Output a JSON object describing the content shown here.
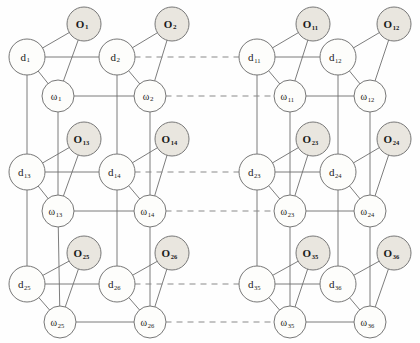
{
  "figure": {
    "type": "node-link-diagram",
    "width": 420,
    "height": 343
  },
  "style": {
    "o_fill": "#e9e6df",
    "o_stroke": "#777777",
    "d_fill": "#fdfdfb",
    "d_stroke": "#777777",
    "w_fill": "#fdfdfb",
    "w_stroke": "#777777",
    "edge_color": "#6e6e6e",
    "dashed_color": "#8a8a8a",
    "background": "#fefefe"
  },
  "geometry": {
    "radius_o": 17,
    "radius_d": 18,
    "radius_w": 16,
    "row_y": {
      "o": [
        24,
        139,
        253
      ],
      "d": [
        57,
        172,
        284
      ],
      "w": [
        96,
        211,
        322
      ]
    },
    "col_x": {
      "d": [
        27,
        117,
        257,
        338
      ],
      "o": [
        84,
        172,
        313,
        394
      ],
      "w": [
        58,
        150,
        290,
        370
      ]
    }
  },
  "nodes": {
    "observation": [
      {
        "id": "O1",
        "label": "O",
        "sub": "1",
        "x": 84,
        "y": 24
      },
      {
        "id": "O2",
        "label": "O",
        "sub": "2",
        "x": 172,
        "y": 24
      },
      {
        "id": "O11",
        "label": "O",
        "sub": "11",
        "x": 313,
        "y": 24
      },
      {
        "id": "O12",
        "label": "O",
        "sub": "12",
        "x": 394,
        "y": 24
      },
      {
        "id": "O13",
        "label": "O",
        "sub": "13",
        "x": 84,
        "y": 139
      },
      {
        "id": "O14",
        "label": "O",
        "sub": "14",
        "x": 172,
        "y": 139
      },
      {
        "id": "O23",
        "label": "O",
        "sub": "23",
        "x": 313,
        "y": 139
      },
      {
        "id": "O24",
        "label": "O",
        "sub": "24",
        "x": 394,
        "y": 139
      },
      {
        "id": "O25",
        "label": "O",
        "sub": "25",
        "x": 84,
        "y": 253
      },
      {
        "id": "O26",
        "label": "O",
        "sub": "26",
        "x": 172,
        "y": 253
      },
      {
        "id": "O35",
        "label": "O",
        "sub": "35",
        "x": 313,
        "y": 253
      },
      {
        "id": "O36",
        "label": "O",
        "sub": "36",
        "x": 394,
        "y": 253
      }
    ],
    "decision": [
      {
        "id": "d1",
        "label": "d",
        "sub": "1",
        "x": 27,
        "y": 57
      },
      {
        "id": "d2",
        "label": "d",
        "sub": "2",
        "x": 117,
        "y": 57
      },
      {
        "id": "d11",
        "label": "d",
        "sub": "11",
        "x": 257,
        "y": 57
      },
      {
        "id": "d12",
        "label": "d",
        "sub": "12",
        "x": 338,
        "y": 57
      },
      {
        "id": "d13",
        "label": "d",
        "sub": "13",
        "x": 27,
        "y": 172
      },
      {
        "id": "d14",
        "label": "d",
        "sub": "14",
        "x": 117,
        "y": 172
      },
      {
        "id": "d23",
        "label": "d",
        "sub": "23",
        "x": 257,
        "y": 172
      },
      {
        "id": "d24",
        "label": "d",
        "sub": "24",
        "x": 338,
        "y": 172
      },
      {
        "id": "d25",
        "label": "d",
        "sub": "25",
        "x": 27,
        "y": 284
      },
      {
        "id": "d26",
        "label": "d",
        "sub": "26",
        "x": 117,
        "y": 284
      },
      {
        "id": "d35",
        "label": "d",
        "sub": "35",
        "x": 257,
        "y": 284
      },
      {
        "id": "d36",
        "label": "d",
        "sub": "36",
        "x": 338,
        "y": 284
      }
    ],
    "weight": [
      {
        "id": "w1",
        "label": "ω",
        "sub": "1",
        "x": 58,
        "y": 96
      },
      {
        "id": "w2",
        "label": "ω",
        "sub": "2",
        "x": 150,
        "y": 96
      },
      {
        "id": "w11",
        "label": "ω",
        "sub": "11",
        "x": 290,
        "y": 96
      },
      {
        "id": "w12",
        "label": "ω",
        "sub": "12",
        "x": 370,
        "y": 96
      },
      {
        "id": "w13",
        "label": "ω",
        "sub": "13",
        "x": 58,
        "y": 211
      },
      {
        "id": "w14",
        "label": "ω",
        "sub": "14",
        "x": 150,
        "y": 211
      },
      {
        "id": "w23",
        "label": "ω",
        "sub": "23",
        "x": 290,
        "y": 211
      },
      {
        "id": "w24",
        "label": "ω",
        "sub": "24",
        "x": 370,
        "y": 211
      },
      {
        "id": "w25",
        "label": "ω",
        "sub": "25",
        "x": 60,
        "y": 322
      },
      {
        "id": "w26",
        "label": "ω",
        "sub": "26",
        "x": 150,
        "y": 322
      },
      {
        "id": "w35",
        "label": "ω",
        "sub": "35",
        "x": 290,
        "y": 322
      },
      {
        "id": "w36",
        "label": "ω",
        "sub": "36",
        "x": 370,
        "y": 322
      }
    ]
  },
  "edges": {
    "solid": [
      [
        "d1",
        "O1"
      ],
      [
        "d1",
        "w1"
      ],
      [
        "d1",
        "d2"
      ],
      [
        "O1",
        "w1"
      ],
      [
        "w1",
        "w2"
      ],
      [
        "d2",
        "O2"
      ],
      [
        "d2",
        "w2"
      ],
      [
        "O2",
        "w2"
      ],
      [
        "d11",
        "O11"
      ],
      [
        "d11",
        "w11"
      ],
      [
        "d11",
        "d12"
      ],
      [
        "O11",
        "w11"
      ],
      [
        "w11",
        "w12"
      ],
      [
        "d12",
        "O12"
      ],
      [
        "d12",
        "w12"
      ],
      [
        "O12",
        "w12"
      ],
      [
        "d13",
        "O13"
      ],
      [
        "d13",
        "w13"
      ],
      [
        "d13",
        "d14"
      ],
      [
        "O13",
        "w13"
      ],
      [
        "w13",
        "w14"
      ],
      [
        "d14",
        "O14"
      ],
      [
        "d14",
        "w14"
      ],
      [
        "O14",
        "w14"
      ],
      [
        "d23",
        "O23"
      ],
      [
        "d23",
        "w23"
      ],
      [
        "d23",
        "d24"
      ],
      [
        "O23",
        "w23"
      ],
      [
        "w23",
        "w24"
      ],
      [
        "d24",
        "O24"
      ],
      [
        "d24",
        "w24"
      ],
      [
        "O24",
        "w24"
      ],
      [
        "d25",
        "O25"
      ],
      [
        "d25",
        "w25"
      ],
      [
        "d25",
        "d26"
      ],
      [
        "O25",
        "w25"
      ],
      [
        "w25",
        "w26"
      ],
      [
        "d26",
        "O26"
      ],
      [
        "d26",
        "w26"
      ],
      [
        "O26",
        "w26"
      ],
      [
        "d35",
        "O35"
      ],
      [
        "d35",
        "w35"
      ],
      [
        "d35",
        "d36"
      ],
      [
        "O35",
        "w35"
      ],
      [
        "w35",
        "w36"
      ],
      [
        "d36",
        "O36"
      ],
      [
        "d36",
        "w36"
      ],
      [
        "O36",
        "w36"
      ],
      [
        "d1",
        "d13"
      ],
      [
        "d13",
        "d25"
      ],
      [
        "d2",
        "d14"
      ],
      [
        "d14",
        "d26"
      ],
      [
        "d11",
        "d23"
      ],
      [
        "d23",
        "d35"
      ],
      [
        "d12",
        "d24"
      ],
      [
        "d24",
        "d36"
      ],
      [
        "w1",
        "w13"
      ],
      [
        "w13",
        "w25"
      ],
      [
        "w2",
        "w14"
      ],
      [
        "w14",
        "w26"
      ],
      [
        "w11",
        "w23"
      ],
      [
        "w23",
        "w35"
      ],
      [
        "w12",
        "w24"
      ],
      [
        "w24",
        "w36"
      ]
    ],
    "dashed": [
      [
        "d2",
        "d11"
      ],
      [
        "w2",
        "w11"
      ],
      [
        "d14",
        "d23"
      ],
      [
        "w14",
        "w23"
      ],
      [
        "d26",
        "d35"
      ],
      [
        "w26",
        "w35"
      ]
    ]
  },
  "groups": {
    "left_block_label": "left lattice block",
    "right_block_label": "right lattice block",
    "ellipsis_note": "dashed horizontal links indicate omitted intermediate columns"
  }
}
